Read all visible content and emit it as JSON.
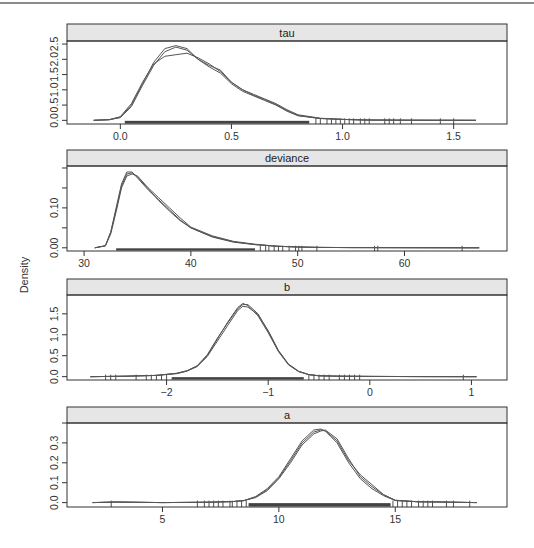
{
  "figure": {
    "ylabel": "Density",
    "strip_color": "#e6e6e6",
    "line_color": "#555555",
    "rug_color": "#222222"
  },
  "chart_data": [
    {
      "type": "line",
      "title": "tau",
      "xlabel": "",
      "ylabel": "Density",
      "x_ticks": [
        0.0,
        0.5,
        1.0,
        1.5
      ],
      "x_tick_labels": [
        "0.0",
        "0.5",
        "1.0",
        "1.5"
      ],
      "y_ticks": [
        0.0,
        0.5,
        1.0,
        1.5,
        2.0,
        2.5
      ],
      "y_tick_labels": [
        "0.0",
        "0.5",
        "1.0",
        "1.5",
        "2.0",
        "2.5"
      ],
      "xlim": [
        -0.24,
        1.74
      ],
      "ylim": [
        -0.12,
        2.6
      ],
      "grid": false,
      "series": [
        {
          "name": "chain 1",
          "x": [
            -0.12,
            -0.05,
            0.0,
            0.05,
            0.1,
            0.15,
            0.2,
            0.25,
            0.3,
            0.35,
            0.4,
            0.45,
            0.5,
            0.55,
            0.6,
            0.65,
            0.7,
            0.75,
            0.8,
            0.9,
            1.0,
            1.1,
            1.3,
            1.6
          ],
          "y": [
            0.0,
            0.02,
            0.1,
            0.5,
            1.2,
            1.9,
            2.35,
            2.45,
            2.35,
            2.0,
            1.75,
            1.55,
            1.2,
            0.95,
            0.8,
            0.65,
            0.5,
            0.3,
            0.15,
            0.06,
            0.03,
            0.01,
            0.005,
            0.0
          ]
        },
        {
          "name": "chain 2",
          "x": [
            -0.12,
            -0.05,
            0.0,
            0.05,
            0.1,
            0.15,
            0.2,
            0.25,
            0.3,
            0.35,
            0.4,
            0.45,
            0.5,
            0.55,
            0.6,
            0.65,
            0.7,
            0.75,
            0.8,
            0.9,
            1.0,
            1.1,
            1.3,
            1.6
          ],
          "y": [
            0.0,
            0.02,
            0.12,
            0.55,
            1.25,
            1.85,
            2.1,
            2.15,
            2.2,
            2.05,
            1.85,
            1.6,
            1.25,
            1.0,
            0.85,
            0.7,
            0.55,
            0.35,
            0.18,
            0.07,
            0.03,
            0.01,
            0.005,
            0.0
          ]
        },
        {
          "name": "chain 3",
          "x": [
            -0.12,
            -0.05,
            0.0,
            0.05,
            0.1,
            0.15,
            0.2,
            0.25,
            0.3,
            0.35,
            0.4,
            0.45,
            0.5,
            0.55,
            0.6,
            0.65,
            0.7,
            0.75,
            0.8,
            0.9,
            1.0,
            1.1,
            1.3,
            1.6
          ],
          "y": [
            0.0,
            0.02,
            0.09,
            0.45,
            1.15,
            1.8,
            2.25,
            2.4,
            2.3,
            2.0,
            1.8,
            1.65,
            1.25,
            1.0,
            0.82,
            0.68,
            0.52,
            0.32,
            0.16,
            0.06,
            0.03,
            0.01,
            0.005,
            0.0
          ]
        }
      ],
      "rug": {
        "dense_range": [
          0.02,
          0.85
        ],
        "sparse": [
          0.88,
          0.9,
          0.93,
          0.95,
          0.97,
          0.99,
          1.01,
          1.03,
          1.05,
          1.08,
          1.1,
          1.12,
          1.19,
          1.21,
          1.23,
          1.26,
          1.31,
          1.44,
          1.5
        ]
      }
    },
    {
      "type": "line",
      "title": "deviance",
      "xlabel": "",
      "ylabel": "Density",
      "x_ticks": [
        30,
        40,
        50,
        60
      ],
      "x_tick_labels": [
        "30",
        "40",
        "50",
        "60"
      ],
      "y_ticks": [
        0.0,
        0.05,
        0.1,
        0.15,
        0.2
      ],
      "y_tick_labels": [
        "0.00",
        "",
        "0.10",
        "",
        ""
      ],
      "xlim": [
        28.4,
        69.6
      ],
      "ylim": [
        -0.008,
        0.205
      ],
      "grid": false,
      "series": [
        {
          "name": "chain 1",
          "x": [
            31,
            32,
            32.5,
            33,
            33.5,
            34,
            34.5,
            35,
            36,
            37,
            38,
            39,
            40,
            42,
            44,
            46,
            48,
            50,
            52,
            55,
            60,
            67
          ],
          "y": [
            0.0,
            0.005,
            0.04,
            0.1,
            0.16,
            0.19,
            0.19,
            0.175,
            0.145,
            0.12,
            0.095,
            0.07,
            0.05,
            0.028,
            0.015,
            0.008,
            0.004,
            0.002,
            0.001,
            0.0005,
            0.0002,
            0.0
          ]
        },
        {
          "name": "chain 2",
          "x": [
            31,
            32,
            32.5,
            33,
            33.5,
            34,
            34.5,
            35,
            36,
            37,
            38,
            39,
            40,
            42,
            44,
            46,
            48,
            50,
            52,
            55,
            60,
            67
          ],
          "y": [
            0.0,
            0.005,
            0.035,
            0.09,
            0.15,
            0.18,
            0.185,
            0.18,
            0.15,
            0.125,
            0.1,
            0.075,
            0.052,
            0.03,
            0.016,
            0.009,
            0.004,
            0.002,
            0.001,
            0.0005,
            0.0002,
            0.0
          ]
        },
        {
          "name": "chain 3",
          "x": [
            31,
            32,
            32.5,
            33,
            33.5,
            34,
            34.5,
            35,
            36,
            37,
            38,
            39,
            40,
            42,
            44,
            46,
            48,
            50,
            52,
            55,
            60,
            67
          ],
          "y": [
            0.0,
            0.005,
            0.04,
            0.095,
            0.155,
            0.185,
            0.188,
            0.178,
            0.148,
            0.118,
            0.092,
            0.068,
            0.05,
            0.027,
            0.014,
            0.008,
            0.004,
            0.002,
            0.001,
            0.0005,
            0.0002,
            0.0
          ]
        }
      ],
      "rug": {
        "dense_range": [
          33.0,
          46.0
        ],
        "sparse": [
          46.5,
          47,
          47.3,
          47.8,
          48.2,
          48.6,
          49.2,
          49.8,
          50.1,
          50.4,
          51.8,
          57.2,
          57.5,
          65.4
        ]
      }
    },
    {
      "type": "line",
      "title": "b",
      "xlabel": "",
      "ylabel": "Density",
      "x_ticks": [
        -2,
        -1,
        0,
        1
      ],
      "x_tick_labels": [
        "−2",
        "−1",
        "0",
        "1"
      ],
      "y_ticks": [
        0.0,
        0.5,
        1.0,
        1.5
      ],
      "y_tick_labels": [
        "0.0",
        "0.5",
        "1.0",
        "1.5"
      ],
      "xlim": [
        -2.98,
        1.35
      ],
      "ylim": [
        -0.08,
        1.95
      ],
      "grid": false,
      "series": [
        {
          "name": "chain 1",
          "x": [
            -2.75,
            -2.4,
            -2.1,
            -1.9,
            -1.8,
            -1.7,
            -1.6,
            -1.5,
            -1.4,
            -1.3,
            -1.25,
            -1.2,
            -1.1,
            -1.0,
            -0.9,
            -0.8,
            -0.7,
            -0.6,
            -0.5,
            -0.3,
            0.0,
            0.5,
            1.05
          ],
          "y": [
            0.0,
            0.01,
            0.03,
            0.08,
            0.14,
            0.25,
            0.5,
            0.9,
            1.3,
            1.65,
            1.75,
            1.7,
            1.45,
            1.05,
            0.6,
            0.28,
            0.12,
            0.05,
            0.02,
            0.01,
            0.005,
            0.002,
            0.0
          ]
        },
        {
          "name": "chain 2",
          "x": [
            -2.75,
            -2.4,
            -2.1,
            -1.9,
            -1.8,
            -1.7,
            -1.6,
            -1.5,
            -1.4,
            -1.3,
            -1.25,
            -1.2,
            -1.1,
            -1.0,
            -0.9,
            -0.8,
            -0.7,
            -0.6,
            -0.5,
            -0.3,
            0.0,
            0.5,
            1.05
          ],
          "y": [
            0.0,
            0.01,
            0.03,
            0.07,
            0.13,
            0.24,
            0.48,
            0.85,
            1.22,
            1.58,
            1.68,
            1.66,
            1.48,
            1.1,
            0.63,
            0.3,
            0.13,
            0.05,
            0.02,
            0.01,
            0.005,
            0.002,
            0.0
          ]
        },
        {
          "name": "chain 3",
          "x": [
            -2.75,
            -2.4,
            -2.1,
            -1.9,
            -1.8,
            -1.7,
            -1.6,
            -1.5,
            -1.4,
            -1.3,
            -1.25,
            -1.2,
            -1.1,
            -1.0,
            -0.9,
            -0.8,
            -0.7,
            -0.6,
            -0.5,
            -0.3,
            0.0,
            0.5,
            1.05
          ],
          "y": [
            0.0,
            0.01,
            0.03,
            0.08,
            0.14,
            0.26,
            0.52,
            0.92,
            1.28,
            1.62,
            1.72,
            1.72,
            1.5,
            1.08,
            0.61,
            0.29,
            0.12,
            0.05,
            0.02,
            0.01,
            0.005,
            0.002,
            0.0
          ]
        }
      ],
      "rug": {
        "dense_range": [
          -1.95,
          -0.65
        ],
        "sparse": [
          -2.6,
          -2.55,
          -2.5,
          -2.3,
          -2.2,
          -2.15,
          -2.1,
          -2.05,
          -2.0,
          -0.6,
          -0.55,
          -0.5,
          -0.45,
          -0.4,
          -0.3,
          -0.25,
          -0.2,
          -0.15,
          -0.1,
          0.92
        ]
      }
    },
    {
      "type": "line",
      "title": "a",
      "xlabel": "",
      "ylabel": "Density",
      "x_ticks": [
        5,
        10,
        15
      ],
      "x_tick_labels": [
        "5",
        "10",
        "15"
      ],
      "y_ticks": [
        0.0,
        0.1,
        0.2,
        0.3,
        0.4
      ],
      "y_tick_labels": [
        "0.0",
        "0.1",
        "0.2",
        "0.3",
        ""
      ],
      "xlim": [
        0.9,
        19.8
      ],
      "ylim": [
        -0.022,
        0.4
      ],
      "grid": false,
      "series": [
        {
          "name": "chain 1",
          "x": [
            2,
            3,
            5,
            7,
            8,
            8.5,
            9,
            9.5,
            10,
            10.5,
            11,
            11.5,
            11.8,
            12,
            12.5,
            13,
            13.5,
            14,
            14.5,
            15,
            16,
            17,
            18.5
          ],
          "y": [
            0.0,
            0.003,
            0.0,
            0.002,
            0.005,
            0.01,
            0.03,
            0.07,
            0.13,
            0.22,
            0.31,
            0.365,
            0.37,
            0.36,
            0.3,
            0.2,
            0.12,
            0.07,
            0.035,
            0.01,
            0.004,
            0.003,
            0.0
          ]
        },
        {
          "name": "chain 2",
          "x": [
            2,
            3,
            5,
            7,
            8,
            8.5,
            9,
            9.5,
            10,
            10.5,
            11,
            11.5,
            11.8,
            12,
            12.5,
            13,
            13.5,
            14,
            14.5,
            15,
            16,
            17,
            18.5
          ],
          "y": [
            0.0,
            0.003,
            0.0,
            0.002,
            0.005,
            0.01,
            0.025,
            0.06,
            0.12,
            0.2,
            0.29,
            0.345,
            0.36,
            0.365,
            0.32,
            0.22,
            0.13,
            0.08,
            0.04,
            0.012,
            0.004,
            0.003,
            0.0
          ]
        },
        {
          "name": "chain 3",
          "x": [
            2,
            3,
            5,
            7,
            8,
            8.5,
            9,
            9.5,
            10,
            10.5,
            11,
            11.5,
            11.8,
            12,
            12.5,
            13,
            13.5,
            14,
            14.5,
            15,
            16,
            17,
            18.5
          ],
          "y": [
            0.0,
            0.003,
            0.0,
            0.002,
            0.005,
            0.01,
            0.028,
            0.065,
            0.125,
            0.21,
            0.3,
            0.355,
            0.365,
            0.36,
            0.31,
            0.21,
            0.14,
            0.09,
            0.04,
            0.011,
            0.004,
            0.003,
            0.0
          ]
        }
      ],
      "rug": {
        "dense_range": [
          8.7,
          14.8
        ],
        "sparse": [
          2.8,
          6.5,
          6.8,
          7.0,
          7.2,
          7.4,
          7.6,
          7.9,
          8.0,
          8.2,
          8.4,
          8.6,
          14.9,
          15.1,
          15.3,
          15.5,
          15.7,
          16.0,
          16.2,
          16.4,
          16.6,
          17.2,
          17.5,
          18.2
        ]
      }
    }
  ]
}
